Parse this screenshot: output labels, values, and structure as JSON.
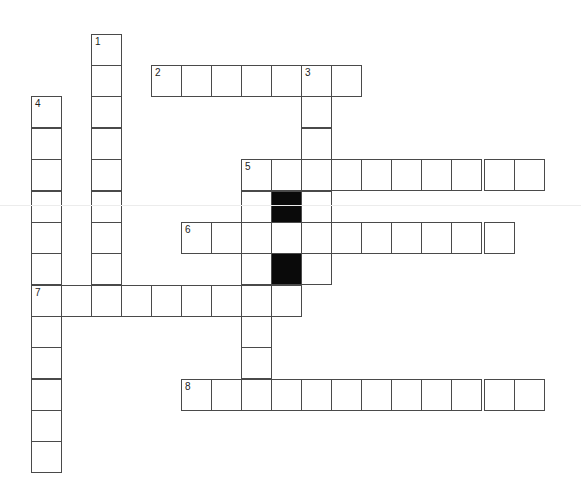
{
  "puzzle": {
    "type": "crossword",
    "cell_size_px": 30,
    "col_x": [
      32,
      62,
      92,
      122,
      152,
      182,
      212,
      242,
      272,
      302,
      332,
      362,
      392,
      422,
      452,
      485,
      515
    ],
    "row_y": [
      35,
      66,
      97,
      129,
      160,
      192,
      223,
      254,
      286,
      317,
      348,
      380,
      411,
      442
    ],
    "words": [
      {
        "number": "1",
        "direction": "down",
        "row": 0,
        "col": 2,
        "length": 8
      },
      {
        "number": "2",
        "direction": "across",
        "row": 1,
        "col": 4,
        "length": 7
      },
      {
        "number": "3",
        "direction": "down",
        "row": 1,
        "col": 9,
        "length": 7
      },
      {
        "number": "4",
        "direction": "down",
        "row": 2,
        "col": 0,
        "length": 12
      },
      {
        "number": "5",
        "direction": "across",
        "row": 4,
        "col": 7,
        "length": 10
      },
      {
        "number": "5",
        "direction": "down",
        "row": 4,
        "col": 7,
        "length": 7
      },
      {
        "number": "6",
        "direction": "across",
        "row": 6,
        "col": 5,
        "length": 11
      },
      {
        "number": "7",
        "direction": "across",
        "row": 8,
        "col": 0,
        "length": 9
      },
      {
        "number": "8",
        "direction": "across",
        "row": 11,
        "col": 5,
        "length": 12
      }
    ],
    "black_cells": [
      {
        "row": 5,
        "col": 8
      },
      {
        "row": 7,
        "col": 8
      }
    ],
    "extra_cells": [
      {
        "row": 5,
        "col": 8
      },
      {
        "row": 7,
        "col": 8
      }
    ]
  }
}
